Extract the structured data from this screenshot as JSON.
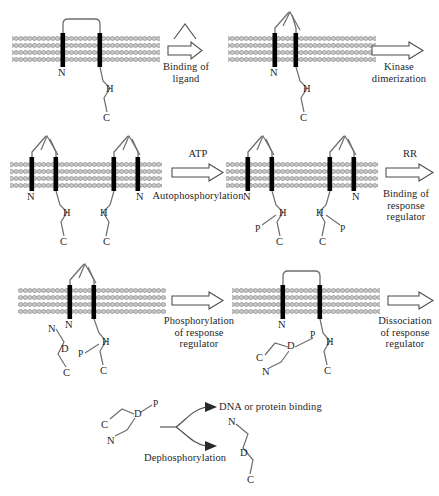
{
  "figure": {
    "type": "diagram",
    "background": "#ffffff",
    "ink": "#1f1f1f",
    "membrane_color": "#8c8c8c",
    "helix_color": "#000000"
  },
  "labels": {
    "binding_of_ligand": "Binding of\nligand",
    "kinase_dimerization": "Kinase\ndimerization",
    "atp": "ATP",
    "autophosphorylation": "Autophosphorylation",
    "rr": "RR",
    "binding_of_response_regulator": "Binding of\nresponse\nregulator",
    "phosphorylation_of_response_regulator": "Phosphorylation\nof response\nregulator",
    "dissociation_of_response_regulator": "Dissociation\nof response\nregulator",
    "dna_or_protein_binding": "DNA or protein binding",
    "dephosphorylation": "Dephosphorylation"
  },
  "atoms": {
    "N": "N",
    "C": "C",
    "H": "H",
    "D": "D",
    "P": "P"
  },
  "panels": [
    {
      "id": "panel-1-monomer-unbound",
      "row": 1,
      "position": "left",
      "description": "Single sensor kinase monomer in membrane, ligand not bound",
      "atom_labels": [
        "N",
        "H",
        "C"
      ],
      "ligand_bound": false,
      "phosphates": 0,
      "response_regulators": 0
    },
    {
      "id": "panel-2-monomer-ligand-bound",
      "row": 1,
      "position": "right",
      "description": "Ligand bound to periplasmic loop of sensor kinase monomer",
      "atom_labels": [
        "N",
        "H",
        "C"
      ],
      "ligand_bound": true,
      "phosphates": 0,
      "response_regulators": 0
    },
    {
      "id": "panel-3-dimer",
      "row": 2,
      "position": "left",
      "description": "Dimerized sensor kinase, both monomers ligand bound",
      "atom_labels": [
        "N",
        "H",
        "C",
        "C",
        "H",
        "N"
      ],
      "ligand_bound": true,
      "phosphates": 0,
      "response_regulators": 0
    },
    {
      "id": "panel-4-autophosphorylated-dimer",
      "row": 2,
      "position": "right",
      "description": "Autophosphorylated dimer, phosphate on each histidine",
      "atom_labels": [
        "N",
        "H",
        "P",
        "C",
        "C",
        "P",
        "H",
        "N"
      ],
      "ligand_bound": true,
      "phosphates": 2,
      "response_regulators": 0
    },
    {
      "id": "panel-5-rr-bound",
      "row": 3,
      "position": "left",
      "description": "Response regulator bound to phosphorylated histidine kinase",
      "atom_labels": [
        "N",
        "N",
        "D",
        "C",
        "P",
        "H",
        "C"
      ],
      "ligand_bound": true,
      "phosphates": 1,
      "response_regulators": 1
    },
    {
      "id": "panel-6-rr-phosphorylated",
      "row": 3,
      "position": "right",
      "description": "Phosphate transferred to aspartate of response regulator",
      "atom_labels": [
        "N",
        "C",
        "D",
        "P",
        "H",
        "N",
        "C"
      ],
      "ligand_bound": false,
      "phosphates": 1,
      "response_regulators": 1
    },
    {
      "id": "panel-7-free-phospho-rr",
      "row": 4,
      "position": "center",
      "description": "Free phosphorylated response regulator with two fates",
      "atom_labels": [
        "C",
        "D",
        "P",
        "N"
      ],
      "ligand_bound": false,
      "phosphates": 1,
      "response_regulators": 1
    },
    {
      "id": "panel-8-dephospho-rr",
      "row": 4,
      "position": "right",
      "description": "Dephosphorylated response regulator",
      "atom_labels": [
        "N",
        "D",
        "C"
      ],
      "ligand_bound": false,
      "phosphates": 0,
      "response_regulators": 1
    }
  ],
  "arrows": [
    {
      "id": "arrow-binding-of-ligand",
      "style": "hollow-block",
      "label_key": "binding_of_ligand",
      "has_ligand_glyph": true
    },
    {
      "id": "arrow-kinase-dimerization",
      "style": "hollow-block",
      "label_key": "kinase_dimerization",
      "has_ligand_glyph": false
    },
    {
      "id": "arrow-autophosphorylation",
      "style": "hollow-block",
      "label_key": "autophosphorylation",
      "top_label_key": "atp"
    },
    {
      "id": "arrow-binding-of-response-regulator",
      "style": "hollow-block",
      "label_key": "binding_of_response_regulator",
      "top_label_key": "rr"
    },
    {
      "id": "arrow-phosphorylation-of-response-regulator",
      "style": "hollow-block",
      "label_key": "phosphorylation_of_response_regulator"
    },
    {
      "id": "arrow-dissociation-of-response-regulator",
      "style": "hollow-block",
      "label_key": "dissociation_of_response_regulator"
    },
    {
      "id": "arrow-dna-or-protein-binding",
      "style": "solid-line",
      "label_key": "dna_or_protein_binding"
    },
    {
      "id": "arrow-dephosphorylation",
      "style": "solid-line",
      "label_key": "dephosphorylation"
    }
  ]
}
